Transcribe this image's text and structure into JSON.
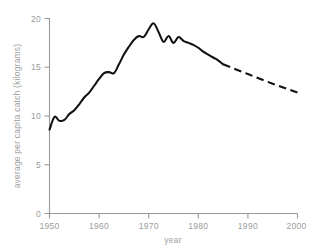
{
  "chart_data": {
    "type": "line",
    "title": "",
    "xlabel": "year",
    "ylabel": "average per capita catch (kilograms)",
    "xlim": [
      1950,
      2000
    ],
    "ylim": [
      0,
      20
    ],
    "xticks": [
      1950,
      1960,
      1970,
      1980,
      1990,
      2000
    ],
    "yticks": [
      0,
      5,
      10,
      15,
      20
    ],
    "xtick_labels": [
      "1950",
      "1960",
      "1970",
      "1980",
      "1990",
      "2000"
    ],
    "ytick_labels": [
      "0",
      "5",
      "10",
      "15",
      "20"
    ],
    "grid": false,
    "legend": null,
    "line_color": "#111111",
    "axis_color": "#9a9a9a",
    "label_color": "#9c9c9c",
    "series": [
      {
        "name": "observed",
        "style": "solid",
        "x": [
          1950,
          1951,
          1952,
          1953,
          1954,
          1955,
          1956,
          1957,
          1958,
          1959,
          1960,
          1961,
          1962,
          1963,
          1964,
          1965,
          1966,
          1967,
          1968,
          1969,
          1970,
          1971,
          1972,
          1973,
          1974,
          1975,
          1976,
          1977,
          1978,
          1979,
          1980,
          1981,
          1982,
          1983,
          1984,
          1985
        ],
        "y": [
          8.6,
          9.9,
          9.5,
          9.6,
          10.2,
          10.6,
          11.2,
          11.9,
          12.4,
          13.1,
          13.8,
          14.4,
          14.5,
          14.4,
          15.3,
          16.3,
          17.1,
          17.8,
          18.2,
          18.1,
          18.9,
          19.5,
          18.6,
          17.6,
          18.2,
          17.5,
          18.1,
          17.7,
          17.5,
          17.3,
          17.0,
          16.6,
          16.3,
          16.0,
          15.7,
          15.3
        ]
      },
      {
        "name": "projection",
        "style": "dashed",
        "x": [
          1985,
          1990,
          1995,
          2000
        ],
        "y": [
          15.3,
          14.3,
          13.3,
          12.4
        ]
      }
    ],
    "annotations": [
      {
        "text": "peak",
        "x": 1971,
        "y": 19.5,
        "visible": false
      }
    ]
  },
  "axes": {
    "x_axis_title": "year",
    "y_axis_title": "average per capita catch (kilograms)"
  }
}
